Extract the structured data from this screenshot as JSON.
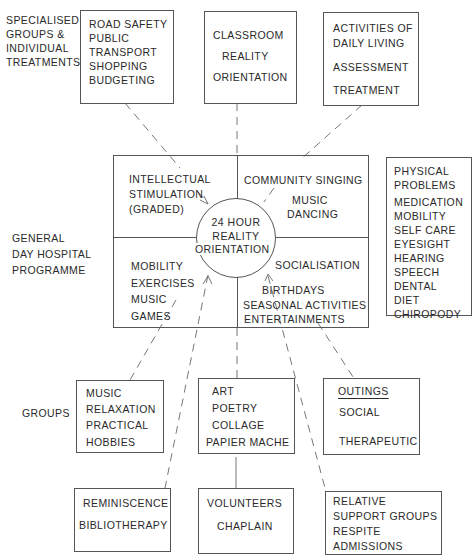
{
  "left_labels": {
    "specialised": [
      "SPECIALISED",
      "GROUPS &",
      "INDIVIDUAL",
      "TREATMENTS"
    ],
    "general": [
      "GENERAL",
      "DAY HOSPITAL",
      "PROGRAMME"
    ],
    "groups": "GROUPS"
  },
  "top_boxes": {
    "road_safety": [
      "ROAD SAFETY",
      "PUBLIC",
      "TRANSPORT",
      "SHOPPING",
      "BUDGETING"
    ],
    "classroom": [
      "CLASSROOM",
      "REALITY",
      "ORIENTATION"
    ],
    "adl": [
      "ACTIVITIES OF",
      "DAILY LIVING",
      "ASSESSMENT",
      "TREATMENT"
    ]
  },
  "center": {
    "circle": [
      "24 HOUR",
      "REALITY",
      "ORIENTATION"
    ],
    "top_left": [
      "INTELLECTUAL",
      "STIMULATION",
      "(GRADED)"
    ],
    "top_right": {
      "line1": "COMMUNITY SINGING",
      "line2": "MUSIC",
      "line3": "DANCING"
    },
    "bottom_left": [
      "MOBILITY",
      "EXERCISES",
      "MUSIC",
      "GAMES"
    ],
    "bottom_right": {
      "line1": "SOCIALISATION",
      "line2": "BIRTHDAYS",
      "line3": "SEASONAL ACTIVITIES",
      "line4": "ENTERTAINMENTS"
    }
  },
  "physical_problems": [
    "PHYSICAL",
    "PROBLEMS",
    "MEDICATION",
    "MOBILITY",
    "SELF CARE",
    "EYESIGHT",
    "HEARING",
    "SPEECH",
    "DENTAL",
    "DIET",
    "CHIROPODY"
  ],
  "bottom_row1": {
    "music_box": [
      "MUSIC",
      "RELAXATION",
      "PRACTICAL",
      "HOBBIES"
    ],
    "art_box": [
      "ART",
      "POETRY",
      "COLLAGE",
      "PAPIER MACHE"
    ],
    "outings_box": {
      "title": "OUTINGS",
      "line2": "SOCIAL",
      "line3": "THERAPEUTIC"
    }
  },
  "bottom_row2": {
    "reminiscence_box": [
      "REMINISCENCE",
      "BIBLIOTHERAPY"
    ],
    "volunteers_box": [
      "VOLUNTEERS",
      "CHAPLAIN"
    ],
    "relative_box": [
      "RELATIVE",
      "SUPPORT GROUPS",
      "RESPITE",
      "ADMISSIONS"
    ]
  },
  "colors": {
    "line": "#555555",
    "text": "#2a2a2a",
    "background": "#ffffff"
  }
}
